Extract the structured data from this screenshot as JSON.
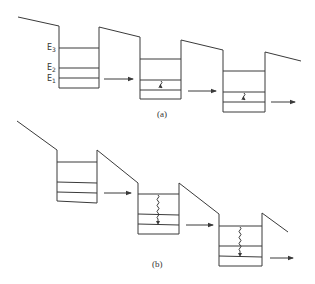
{
  "figure": {
    "type": "energy-band diagram",
    "line_color": "#3a3a3a",
    "panels": [
      {
        "id": "a",
        "caption": "(a)",
        "level_labels": [
          "E3",
          "E2",
          "E1"
        ],
        "wells": 3,
        "relaxation_markers": "short wavy arrow from E2 to E1 in wells 2 and 3"
      },
      {
        "id": "b",
        "caption": "(b)",
        "level_labels": [],
        "wells": 3,
        "relaxation_markers": "long wavy arrow from E3 to E1 in wells 2 and 3"
      }
    ]
  }
}
